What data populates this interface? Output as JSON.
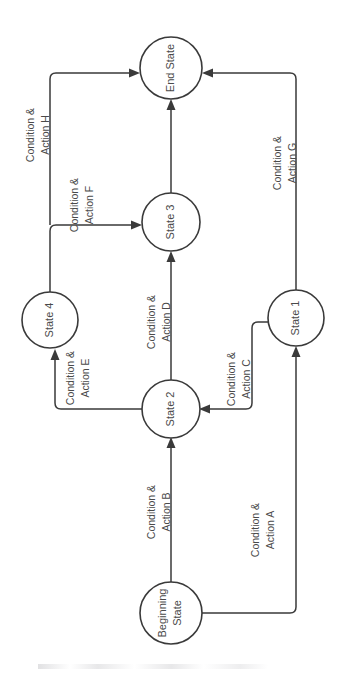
{
  "diagram": {
    "type": "state-machine-diagram",
    "orientation": "rotated-90-ccw",
    "stroke_color": "#3a3a3a",
    "text_color": "#4a4a4a",
    "background_color": "#ffffff",
    "nodes": [
      {
        "id": "end",
        "label": "End State",
        "cx": 171,
        "cy": 68,
        "r": 31
      },
      {
        "id": "state3",
        "label": "State 3",
        "cx": 171,
        "cy": 222,
        "r": 29
      },
      {
        "id": "state4",
        "label": "State 4",
        "cx": 50,
        "cy": 320,
        "r": 28
      },
      {
        "id": "state1",
        "label": "State 1",
        "cx": 296,
        "cy": 318,
        "r": 28
      },
      {
        "id": "state2",
        "label": "State 2",
        "cx": 171,
        "cy": 409,
        "r": 29
      },
      {
        "id": "beginning",
        "label": "Beginning State",
        "cx": 171,
        "cy": 613,
        "r": 31
      }
    ],
    "edges": [
      {
        "id": "edge-a",
        "from": "beginning",
        "to": "state1",
        "label": "Condition &\nAction A",
        "label_x": 263,
        "label_y": 530
      },
      {
        "id": "edge-b",
        "from": "beginning",
        "to": "state2",
        "label": "Condition &\nAction B",
        "label_x": 159,
        "label_y": 512
      },
      {
        "id": "edge-c",
        "from": "state1",
        "to": "state2",
        "label": "Condition &\nAction C",
        "label_x": 239,
        "label_y": 379
      },
      {
        "id": "edge-d",
        "from": "state2",
        "to": "state3",
        "label": "Condition &\nAction D",
        "label_x": 159,
        "label_y": 322
      },
      {
        "id": "edge-e",
        "from": "state2",
        "to": "state4",
        "label": "Condition &\nAction E",
        "label_x": 78,
        "label_y": 378
      },
      {
        "id": "edge-f",
        "from": "state4",
        "to": "state3",
        "label": "Condition &\nAction F",
        "label_x": 82,
        "label_y": 205
      },
      {
        "id": "edge-g",
        "from": "state1",
        "to": "end",
        "label": "Condition &\nAction G",
        "label_x": 285,
        "label_y": 163
      },
      {
        "id": "edge-h",
        "from": "state4",
        "to": "end",
        "label": "Condition &\nAction H",
        "label_x": 38,
        "label_y": 135
      },
      {
        "id": "edge-i",
        "from": "state3",
        "to": "end",
        "label": "",
        "label_x": 0,
        "label_y": 0
      }
    ]
  },
  "node_labels": {
    "end": {
      "line1": "End State"
    },
    "state3": {
      "line1": "State 3"
    },
    "state4": {
      "line1": "State 4"
    },
    "state1": {
      "line1": "State 1"
    },
    "state2": {
      "line1": "State 2"
    },
    "beginning": {
      "line1": "Beginning",
      "line2": "State"
    }
  },
  "edge_labels": {
    "a": {
      "line1": "Condition &",
      "line2": "Action A"
    },
    "b": {
      "line1": "Condition &",
      "line2": "Action B"
    },
    "c": {
      "line1": "Condition &",
      "line2": "Action C"
    },
    "d": {
      "line1": "Condition &",
      "line2": "Action D"
    },
    "e": {
      "line1": "Condition &",
      "line2": "Action E"
    },
    "f": {
      "line1": "Condition &",
      "line2": "Action F"
    },
    "g": {
      "line1": "Condition &",
      "line2": "Action G"
    },
    "h": {
      "line1": "Condition &",
      "line2": "Action H"
    }
  }
}
